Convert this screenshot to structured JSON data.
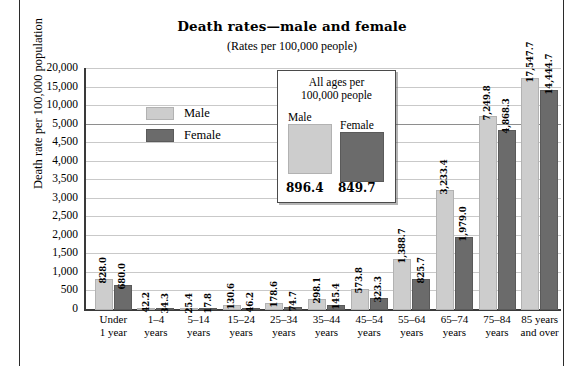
{
  "title": "Death rates—male and female",
  "subtitle": "(Rates per 100,000 people)",
  "ylabel": "Death rate per 100,000 population",
  "legend": {
    "male": "Male",
    "female": "Female"
  },
  "inset": {
    "heading_line1": "All ages per",
    "heading_line2": "100,000 people",
    "male_label": "Male",
    "female_label": "Female",
    "male_value": "896.4",
    "female_value": "849.7"
  },
  "colors": {
    "male_fill": "#cdcdcd",
    "female_fill": "#6b6b6b",
    "gridline": "#c9c9c9",
    "axis": "#3a3a3a",
    "page_rule": "#2b2b2b"
  },
  "yticks": [
    "20,000",
    "15,000",
    "10,000",
    "5,000",
    "4,500",
    "4,000",
    "3,500",
    "3,000",
    "2,500",
    "2,000",
    "1,500",
    "1,000",
    "500",
    "0"
  ],
  "xticks": [
    {
      "line1": "Under",
      "line2": "1 year"
    },
    {
      "line1": "1–4",
      "line2": "years"
    },
    {
      "line1": "5–14",
      "line2": "years"
    },
    {
      "line1": "15–24",
      "line2": "years"
    },
    {
      "line1": "25–34",
      "line2": "years"
    },
    {
      "line1": "35–44",
      "line2": "years"
    },
    {
      "line1": "45–54",
      "line2": "years"
    },
    {
      "line1": "55–64",
      "line2": "years"
    },
    {
      "line1": "65–74",
      "line2": "years"
    },
    {
      "line1": "75–84",
      "line2": "years"
    },
    {
      "line1": "85 years",
      "line2": "and over"
    }
  ],
  "chart_data": {
    "type": "bar",
    "title": "Death rates—male and female",
    "subtitle": "(Rates per 100,000 people)",
    "xlabel": "",
    "ylabel": "Death rate per 100,000 population",
    "ylim": [
      0,
      20000
    ],
    "y_axis_note": "broken/compressed scale: linear 0–5,000 by 500, then 10,000 / 15,000 / 20,000 compressed",
    "ytick_values": [
      20000,
      15000,
      10000,
      5000,
      4500,
      4000,
      3500,
      3000,
      2500,
      2000,
      1500,
      1000,
      500,
      0
    ],
    "grid": true,
    "legend_position": "inside-upper-left",
    "categories": [
      "Under 1 year",
      "1–4 years",
      "5–14 years",
      "15–24 years",
      "25–34 years",
      "35–44 years",
      "45–54 years",
      "55–64 years",
      "65–74 years",
      "75–84 years",
      "85 years and over"
    ],
    "series": [
      {
        "name": "Male",
        "color": "#cdcdcd",
        "values": [
          828.0,
          42.2,
          25.4,
          130.6,
          178.6,
          298.1,
          573.8,
          1388.7,
          3233.4,
          7249.8,
          17547.7
        ],
        "labels": [
          "828.0",
          "42.2",
          "25.4",
          "130.6",
          "178.6",
          "298.1",
          "573.8",
          "1,388.7",
          "3,233.4",
          "7,249.8",
          "17,547.7"
        ]
      },
      {
        "name": "Female",
        "color": "#6b6b6b",
        "values": [
          680.0,
          34.3,
          17.8,
          46.2,
          74.7,
          145.4,
          323.3,
          825.7,
          1979.0,
          4868.3,
          14444.7
        ],
        "labels": [
          "680.0",
          "34.3",
          "17.8",
          "46.2",
          "74.7",
          "145.4",
          "323.3",
          "825.7",
          "1,979.0",
          "4,868.3",
          "14,444.7"
        ]
      }
    ],
    "annotations": {
      "all_ages_male": 896.4,
      "all_ages_female": 849.7
    }
  }
}
